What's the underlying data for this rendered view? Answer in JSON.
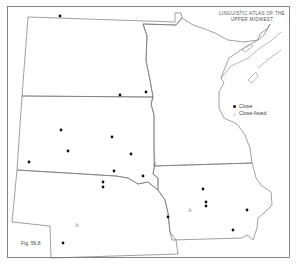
{
  "title": {
    "line1": "LINGUISTIC ATLAS OF THE",
    "line2": "UPPER MIDWEST"
  },
  "legend": {
    "items": [
      {
        "symbol": "dot",
        "label": "Close"
      },
      {
        "symbol": "triangle",
        "label": "Close-fisted"
      }
    ]
  },
  "figure_label": "Fig. 56.8",
  "colors": {
    "border": "#666666",
    "state_line": "#777777",
    "dot": "#111111",
    "triangle": "#999999"
  },
  "points_close": [
    [
      60,
      16
    ],
    [
      120,
      95
    ],
    [
      146,
      92
    ],
    [
      61,
      130
    ],
    [
      112,
      137
    ],
    [
      68,
      151
    ],
    [
      131,
      154
    ],
    [
      29,
      162
    ],
    [
      114,
      171
    ],
    [
      143,
      176
    ],
    [
      103,
      182
    ],
    [
      103,
      187
    ],
    [
      203,
      189
    ],
    [
      206,
      202
    ],
    [
      206,
      206
    ],
    [
      247,
      210
    ],
    [
      168,
      217
    ],
    [
      233,
      230
    ],
    [
      63,
      243
    ]
  ],
  "points_close_fisted": [
    [
      77,
      225
    ],
    [
      190,
      210
    ]
  ]
}
